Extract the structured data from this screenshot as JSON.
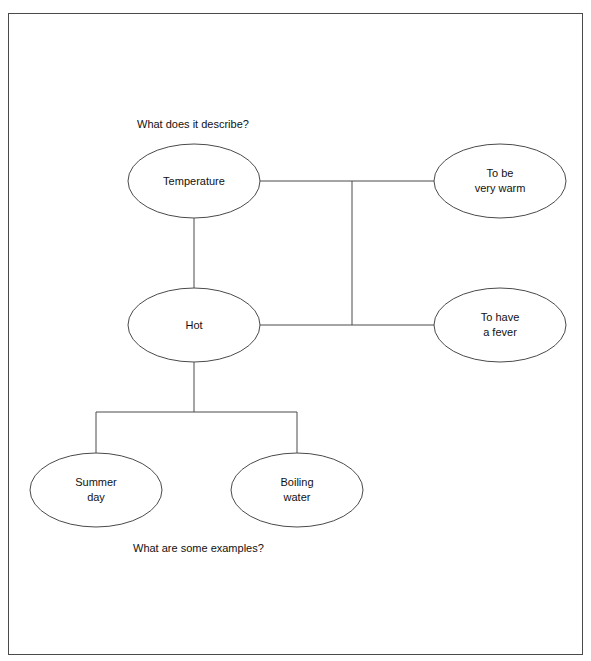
{
  "diagram": {
    "title_question": "What does it describe?",
    "bottom_question": "What are some examples?",
    "stroke_color": "#4a4a4a",
    "text_color": "#111111",
    "background": "#ffffff",
    "nodes": [
      {
        "id": "temperature",
        "label": "Temperature",
        "cx": 194,
        "cy": 181,
        "rx": 66,
        "ry": 37
      },
      {
        "id": "to-be-very-warm",
        "label": "To be\nvery warm",
        "cx": 500,
        "cy": 181,
        "rx": 66,
        "ry": 37
      },
      {
        "id": "hot",
        "label": "Hot",
        "cx": 194,
        "cy": 325,
        "rx": 66,
        "ry": 37
      },
      {
        "id": "to-have-a-fever",
        "label": "To have\na fever",
        "cx": 500,
        "cy": 325,
        "rx": 66,
        "ry": 37
      },
      {
        "id": "summer-day",
        "label": "Summer\nday",
        "cx": 96,
        "cy": 490,
        "rx": 66,
        "ry": 37
      },
      {
        "id": "boiling-water",
        "label": "Boiling\nwater",
        "cx": 297,
        "cy": 490,
        "rx": 66,
        "ry": 37
      }
    ],
    "edges": [
      {
        "id": "temperature-to-warm",
        "points": "260,181 434,181"
      },
      {
        "id": "hot-to-fever",
        "points": "260,325 434,325"
      },
      {
        "id": "vertical-trunk",
        "points": "352,181 352,325"
      },
      {
        "id": "temperature-to-hot",
        "points": "194,218 194,288"
      },
      {
        "id": "hot-to-fork",
        "points": "194,362 194,412"
      },
      {
        "id": "fork-bar",
        "points": "96,412 297,412"
      },
      {
        "id": "fork-left-drop",
        "points": "96,412 96,453"
      },
      {
        "id": "fork-right-drop",
        "points": "297,412 297,453"
      }
    ]
  }
}
